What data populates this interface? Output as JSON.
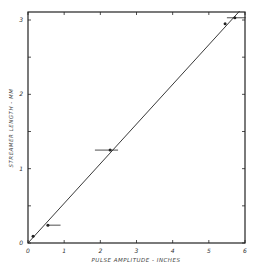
{
  "chart_data": {
    "type": "scatter",
    "title": "",
    "xlabel": "PULSE AMPLITUDE - INCHES",
    "ylabel": "STREAMER LENGTH - MM",
    "xlim": [
      0,
      6
    ],
    "ylim": [
      0,
      3
    ],
    "x_ticks": [
      "0",
      "1",
      "2",
      "3",
      "4",
      "5",
      "6"
    ],
    "y_ticks": [
      "0",
      "1",
      "2",
      "3"
    ],
    "grid": false,
    "series": [
      {
        "name": "measured",
        "points": [
          {
            "x": 0.14,
            "y": 0.09,
            "xerr_low": 0.0,
            "xerr_high": 0.0
          },
          {
            "x": 0.55,
            "y": 0.24,
            "xerr_low": 0.0,
            "xerr_high": 0.35
          },
          {
            "x": 2.27,
            "y": 1.25,
            "xerr_low": 0.42,
            "xerr_high": 0.22
          },
          {
            "x": 5.45,
            "y": 2.95,
            "xerr_low": 0.0,
            "xerr_high": 0.0
          },
          {
            "x": 5.72,
            "y": 3.03,
            "xerr_low": 0.22,
            "xerr_high": 0.3
          }
        ]
      },
      {
        "name": "fit line",
        "type": "line",
        "x": [
          0,
          5.85
        ],
        "y": [
          0,
          3.12
        ]
      }
    ]
  }
}
